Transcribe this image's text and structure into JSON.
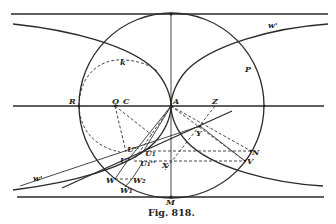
{
  "figure": {
    "caption": "Fig. 818.",
    "labels": {
      "w_top": "w'",
      "w_bottom": "w'",
      "P": "P",
      "k": "k",
      "R": "R",
      "Q": "Q",
      "C": "C",
      "A": "A",
      "Z": "Z",
      "Y": "Y",
      "N": "N",
      "V": "V",
      "X": "X",
      "U": "U'",
      "U2": "U''",
      "U1": "U₁",
      "U1b": "U₁''",
      "W": "W",
      "W2": "W₂",
      "W1": "W₁",
      "M": "M"
    }
  }
}
